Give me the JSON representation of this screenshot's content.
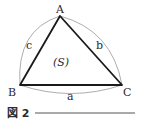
{
  "figure": {
    "caption": "図 2",
    "vertices": {
      "A": "A",
      "B": "B",
      "C": "C"
    },
    "sides": {
      "a": "a",
      "b": "b",
      "c": "c"
    },
    "area_label": "(S)",
    "colors": {
      "stroke": "#1a1a1a",
      "arc": "#8a8a8a",
      "text": "#2a2a2a"
    }
  }
}
